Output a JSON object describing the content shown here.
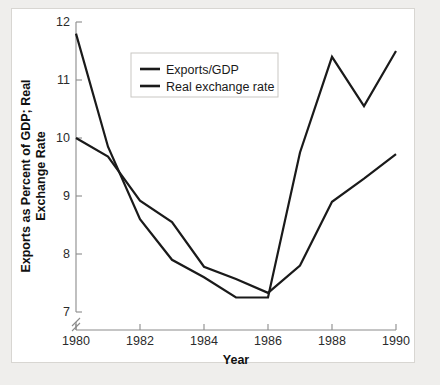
{
  "figure": {
    "background_color": "#ffffff",
    "page_background_color": "#efeeec",
    "border_color": "#d8d6d2"
  },
  "chart_data": {
    "type": "line",
    "title": "",
    "subtitle": "",
    "xlabel": "Year",
    "ylabel": "Exports as Percent of GDP; Real Exchange Rate",
    "ylabel_line1": "Exports as Percent of GDP; Real",
    "ylabel_line2": "Exchange Rate",
    "x": [
      1980,
      1981,
      1982,
      1983,
      1984,
      1985,
      1986,
      1987,
      1988,
      1989,
      1990
    ],
    "xlim": [
      1980,
      1990
    ],
    "ylim": [
      7,
      12
    ],
    "xticks": [
      1980,
      1982,
      1984,
      1986,
      1988,
      1990
    ],
    "xticklabels": [
      "1980",
      "1982",
      "1984",
      "1986",
      "1988",
      "1990"
    ],
    "yticks": [
      7,
      8,
      9,
      10,
      11,
      12
    ],
    "yticklabels": [
      "7",
      "8",
      "9",
      "10",
      "11",
      "12"
    ],
    "y_axis_break": true,
    "grid": false,
    "legend_position": "upper-center-left",
    "line_color": "#1a1a1a",
    "series": [
      {
        "name": "Exports/GDP",
        "values": [
          11.8,
          9.85,
          8.6,
          7.9,
          7.6,
          7.25,
          7.25,
          9.75,
          11.4,
          10.55,
          11.5
        ]
      },
      {
        "name": "Real exchange rate",
        "values": [
          10.0,
          9.68,
          8.92,
          8.55,
          7.78,
          7.57,
          7.33,
          7.8,
          8.9,
          9.3,
          9.72
        ]
      }
    ]
  },
  "legend": {
    "entries": [
      {
        "label": "Exports/GDP"
      },
      {
        "label": "Real exchange rate"
      }
    ]
  },
  "axes": {
    "x_title": "Year",
    "y_title_line1": "Exports as Percent of GDP; Real",
    "y_title_line2": "Exchange Rate"
  }
}
